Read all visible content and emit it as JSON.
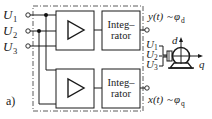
{
  "figure": {
    "label": "a)",
    "inputs": [
      {
        "symbol": "U",
        "subscript": "1"
      },
      {
        "symbol": "U",
        "subscript": "2"
      },
      {
        "symbol": "U",
        "subscript": "3"
      }
    ],
    "channels": [
      {
        "amplifier": {
          "symbol": "triangle"
        },
        "integrator": {
          "line1": "Integ–",
          "line2": "rator"
        },
        "output": {
          "signal": "y(t)",
          "sep": "~",
          "phi": "φ",
          "phi_sub": "d"
        }
      },
      {
        "amplifier": {
          "symbol": "triangle"
        },
        "integrator": {
          "line1": "Integ–",
          "line2": "rator"
        },
        "output": {
          "signal": "x(t)",
          "sep": "~",
          "phi": "φ",
          "phi_sub": "q"
        }
      }
    ],
    "motor": {
      "inputs": [
        {
          "symbol": "U",
          "subscript": "1"
        },
        {
          "symbol": "U",
          "subscript": "2"
        },
        {
          "symbol": "U",
          "subscript": "3"
        }
      ],
      "axis_d": "d",
      "axis_q": "q"
    }
  }
}
